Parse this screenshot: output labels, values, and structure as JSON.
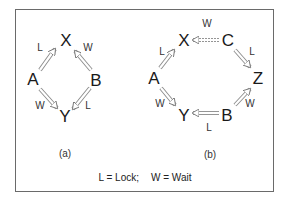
{
  "diagram": {
    "panels": [
      {
        "id": "a",
        "caption": "(a)",
        "nodes": [
          {
            "id": "X",
            "label": "X"
          },
          {
            "id": "A",
            "label": "A"
          },
          {
            "id": "B",
            "label": "B"
          },
          {
            "id": "Y",
            "label": "Y"
          }
        ],
        "edges": [
          {
            "from": "A",
            "to": "X",
            "label": "L"
          },
          {
            "from": "B",
            "to": "X",
            "label": "W"
          },
          {
            "from": "A",
            "to": "Y",
            "label": "W"
          },
          {
            "from": "B",
            "to": "Y",
            "label": "L"
          }
        ]
      },
      {
        "id": "b",
        "caption": "(b)",
        "nodes": [
          {
            "id": "X",
            "label": "X"
          },
          {
            "id": "C",
            "label": "C"
          },
          {
            "id": "A",
            "label": "A"
          },
          {
            "id": "Z",
            "label": "Z"
          },
          {
            "id": "Y",
            "label": "Y"
          },
          {
            "id": "B",
            "label": "B"
          }
        ],
        "edges": [
          {
            "from": "C",
            "to": "X",
            "label": "W"
          },
          {
            "from": "A",
            "to": "X",
            "label": "L"
          },
          {
            "from": "C",
            "to": "Z",
            "label": "L"
          },
          {
            "from": "A",
            "to": "Y",
            "label": "W"
          },
          {
            "from": "B",
            "to": "Z",
            "label": "W"
          },
          {
            "from": "B",
            "to": "Y",
            "label": "L"
          }
        ]
      }
    ],
    "legend": {
      "lock": "L = Lock;",
      "wait": "W = Wait"
    }
  }
}
